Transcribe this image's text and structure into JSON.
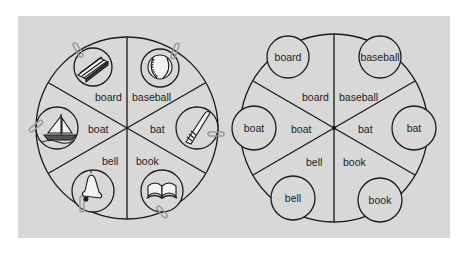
{
  "figure": {
    "background_color": "#d8d8d8",
    "line_color": "#1a1a1a",
    "wheels": [
      {
        "id": "picture-wheel",
        "sectors": [
          {
            "word": "board",
            "picture": "board-icon"
          },
          {
            "word": "baseball",
            "picture": "baseball-icon"
          },
          {
            "word": "bat",
            "picture": "bat-icon"
          },
          {
            "word": "book",
            "picture": "book-icon"
          },
          {
            "word": "bell",
            "picture": "bell-icon"
          },
          {
            "word": "boat",
            "picture": "boat-icon"
          }
        ]
      },
      {
        "id": "word-wheel",
        "sectors": [
          {
            "word": "board",
            "circle_label": "board"
          },
          {
            "word": "baseball",
            "circle_label": "baseball"
          },
          {
            "word": "bat",
            "circle_label": "bat"
          },
          {
            "word": "book",
            "circle_label": "book"
          },
          {
            "word": "bell",
            "circle_label": "bell"
          },
          {
            "word": "boat",
            "circle_label": "boat"
          }
        ]
      }
    ]
  }
}
